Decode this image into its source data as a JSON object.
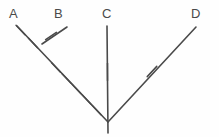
{
  "figure": {
    "kind": "ray-diagram",
    "width": 219,
    "height": 137,
    "background_color": "#fefefe",
    "stroke_color": "#4a4a4a",
    "label_color": "#4a4a4a",
    "stroke_width": 1.6,
    "tick_stroke_width": 1.5,
    "vertex": {
      "x": 108,
      "y": 122
    }
  },
  "labels": [
    {
      "id": "A",
      "text": "A",
      "x": 9,
      "y": 7
    },
    {
      "id": "B",
      "text": "B",
      "x": 54,
      "y": 7
    },
    {
      "id": "C",
      "text": "C",
      "x": 102,
      "y": 7
    },
    {
      "id": "D",
      "text": "D",
      "x": 191,
      "y": 7
    }
  ],
  "rays": [
    {
      "id": "ray-a",
      "label": "A",
      "x1": 108,
      "y1": 122,
      "x2": 17,
      "y2": 26,
      "tick_count": 7
    },
    {
      "id": "ray-b",
      "label": "B",
      "x1": 42,
      "y1": 44,
      "x2": 67,
      "y2": 27,
      "tick_count": 1
    },
    {
      "id": "ray-c",
      "label": "C",
      "x1": 107,
      "y1": 26,
      "x2": 108,
      "y2": 133,
      "tick_count": 1
    },
    {
      "id": "ray-d",
      "label": "D",
      "x1": 108,
      "y1": 122,
      "x2": 196,
      "y2": 27,
      "tick_count": 1
    }
  ],
  "ticks": [
    {
      "id": "tick-a-1",
      "cx": 20.5,
      "cy": 30.0,
      "angle_deg": 46.5,
      "length": 13
    },
    {
      "id": "tick-a-2",
      "cx": 33.0,
      "cy": 43.0,
      "angle_deg": 46.5,
      "length": 13
    },
    {
      "id": "tick-a-3",
      "cx": 56.0,
      "cy": 67.5,
      "angle_deg": 46.5,
      "length": 13
    },
    {
      "id": "tick-a-4",
      "cx": 66.5,
      "cy": 78.5,
      "angle_deg": 46.5,
      "length": 13
    },
    {
      "id": "tick-a-5",
      "cx": 76.5,
      "cy": 89.0,
      "angle_deg": 46.5,
      "length": 13
    },
    {
      "id": "tick-a-6",
      "cx": 86.5,
      "cy": 99.5,
      "angle_deg": 46.5,
      "length": 13
    },
    {
      "id": "tick-a-7",
      "cx": 96.5,
      "cy": 110.0,
      "angle_deg": 46.5,
      "length": 13
    },
    {
      "id": "tick-b-1",
      "cx": 51.0,
      "cy": 36.0,
      "angle_deg": -34.0,
      "length": 13
    },
    {
      "id": "tick-c-1",
      "cx": 107.5,
      "cy": 72.0,
      "angle_deg": 90.0,
      "length": 17
    },
    {
      "id": "tick-d-1",
      "cx": 152.0,
      "cy": 71.5,
      "angle_deg": -47.0,
      "length": 14
    }
  ]
}
